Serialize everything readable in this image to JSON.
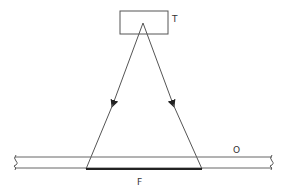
{
  "diagram": {
    "type": "schematic",
    "labels": {
      "source": "T",
      "plate": "O",
      "footprint": "F"
    },
    "colors": {
      "line": "#555555",
      "text": "#333333",
      "background": "#ffffff"
    },
    "elements": [
      {
        "id": "T",
        "kind": "box",
        "description": "source box at top"
      },
      {
        "id": "rays",
        "kind": "arrows",
        "count": 2,
        "direction": "downward from T to plate"
      },
      {
        "id": "O",
        "kind": "plate",
        "description": "horizontal strip with break marks at both ends"
      },
      {
        "id": "F",
        "kind": "segment",
        "description": "thick segment on bottom of plate between ray endpoints"
      }
    ]
  }
}
